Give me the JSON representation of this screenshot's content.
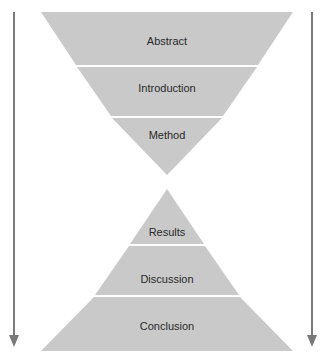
{
  "diagram": {
    "type": "hourglass",
    "fill_color": "#c9c9c9",
    "arrow_color": "#7a7a7a",
    "top_sections": [
      {
        "label": "Abstract"
      },
      {
        "label": "Introduction"
      },
      {
        "label": "Method"
      }
    ],
    "bottom_sections": [
      {
        "label": "Results"
      },
      {
        "label": "Discussion"
      },
      {
        "label": "Conclusion"
      }
    ],
    "arrows": [
      {
        "side": "left",
        "direction": "down"
      },
      {
        "side": "right",
        "direction": "down"
      }
    ]
  }
}
